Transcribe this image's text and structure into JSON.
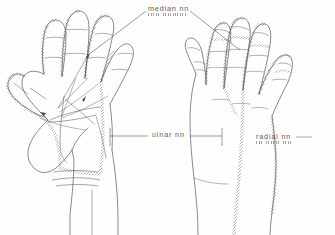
{
  "figure": {
    "view_left": "palmar",
    "view_right": "dorsal",
    "background_color": "#fefefe",
    "ink_color": "#4a4a4a",
    "label_color": "#5b5b5b"
  },
  "labels": {
    "median": {
      "text": "median nn",
      "x": 148,
      "y": 5,
      "underline": true,
      "underline_x": 148,
      "underline_y": 12.5,
      "underline_width": 38
    },
    "ulnar": {
      "text": "ulnar nn",
      "x": 152,
      "y": 131,
      "underline": false
    },
    "radial": {
      "text": "radial nn",
      "x": 256,
      "y": 133,
      "underline": true,
      "underline_x": 256,
      "underline_y": 140.5,
      "underline_width": 36
    }
  },
  "leader_lines": [
    {
      "name": "median-to-left-hand",
      "from_x": 146,
      "from_y": 11,
      "to_x": 100,
      "to_y": 46
    },
    {
      "name": "median-to-right-hand",
      "from_x": 190,
      "from_y": 11,
      "to_x": 232,
      "to_y": 44
    },
    {
      "name": "ulnar-left-segment",
      "from_x": 110,
      "from_y": 136,
      "to_x": 148,
      "to_y": 136
    },
    {
      "name": "ulnar-right-segment",
      "from_x": 190,
      "from_y": 136,
      "to_x": 222,
      "to_y": 136
    },
    {
      "name": "radial-pointer",
      "from_x": 296,
      "from_y": 137,
      "to_x": 312,
      "to_y": 137
    }
  ]
}
